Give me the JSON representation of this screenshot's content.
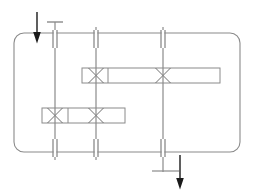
{
  "canvas": {
    "width": 254,
    "height": 190,
    "background": "#ffffff"
  },
  "style": {
    "line_color": "#8a8a8a",
    "line_color_dark": "#6f6f6f",
    "arrow_color": "#1a1a1a",
    "fill_none": "none",
    "stroke_width_thin": 1,
    "stroke_width_medium": 1.2
  },
  "diagram": {
    "type": "piping-schematic",
    "enclosure": {
      "name": "rounded-rectangle-loop",
      "x": 14,
      "y": 33,
      "width": 226,
      "height": 119,
      "corner_radius": 10,
      "stroke": "#8a8a8a"
    },
    "vertical_lines": [
      {
        "id": "riser-1",
        "x": 55,
        "y_top": 22,
        "y_bottom": 160,
        "top_cap": {
          "x1": 47,
          "x2": 63,
          "y": 22
        },
        "bottom_cap": null
      },
      {
        "id": "riser-2",
        "x": 96,
        "y_top": 27,
        "y_bottom": 160,
        "top_cap": null,
        "bottom_cap": null
      },
      {
        "id": "riser-3",
        "x": 163,
        "y_top": 27,
        "y_bottom": 172,
        "top_cap": null,
        "bottom_cap": {
          "x1": 152,
          "x2": 179,
          "y": 171
        }
      }
    ],
    "break_symbols": [
      {
        "id": "break-top-1",
        "cx": 55,
        "cy": 39,
        "half_height": 9,
        "gap": 3
      },
      {
        "id": "break-top-2",
        "cx": 96,
        "cy": 39,
        "half_height": 9,
        "gap": 3
      },
      {
        "id": "break-top-3",
        "cx": 163,
        "cy": 39,
        "half_height": 9,
        "gap": 3
      },
      {
        "id": "break-bottom-1",
        "cx": 55,
        "cy": 148,
        "half_height": 9,
        "gap": 3
      },
      {
        "id": "break-bottom-2",
        "cx": 96,
        "cy": 148,
        "half_height": 9,
        "gap": 3
      },
      {
        "id": "break-bottom-3",
        "cx": 163,
        "cy": 148,
        "half_height": 9,
        "gap": 3
      }
    ],
    "horizontal_bars": [
      {
        "id": "upper-manifold",
        "x": 82,
        "y": 68,
        "width": 138,
        "height": 15,
        "dividers": [
          108
        ],
        "valves": [
          {
            "id": "valve-upper-left",
            "cx": 96,
            "cy": 75.5,
            "size": 15
          },
          {
            "id": "valve-upper-right",
            "cx": 163,
            "cy": 75.5,
            "size": 15
          }
        ]
      },
      {
        "id": "lower-manifold",
        "x": 42,
        "y": 108,
        "width": 83,
        "height": 15,
        "dividers": [
          68
        ],
        "valves": [
          {
            "id": "valve-lower-left",
            "cx": 55,
            "cy": 115.5,
            "size": 15
          },
          {
            "id": "valve-lower-right",
            "cx": 96,
            "cy": 115.5,
            "size": 15
          }
        ]
      }
    ],
    "arrows": [
      {
        "id": "inlet-arrow",
        "direction": "down",
        "x": 37,
        "y_start": 12,
        "y_end": 34,
        "color": "#1a1a1a"
      },
      {
        "id": "outlet-arrow",
        "direction": "down",
        "x": 180,
        "y_start": 155,
        "y_end": 180,
        "color": "#1a1a1a"
      }
    ]
  }
}
